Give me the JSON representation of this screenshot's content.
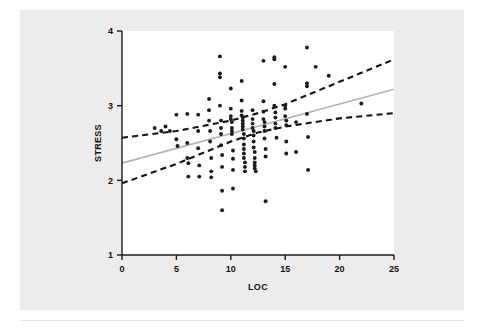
{
  "figure": {
    "background_color": "#ececec",
    "plot_background_color": "#ffffff"
  },
  "chart_data": {
    "type": "scatter",
    "title": "",
    "xlabel": "LOC",
    "ylabel": "STRESS",
    "xlim": [
      0,
      25
    ],
    "ylim": [
      1,
      4
    ],
    "xticks": [
      0,
      5,
      10,
      15,
      20,
      25
    ],
    "xtick_labels": [
      "0",
      "5",
      "10",
      "15",
      "20",
      "25"
    ],
    "yticks": [
      1,
      2,
      3,
      4
    ],
    "ytick_labels": [
      "1",
      "2",
      "3",
      "4"
    ],
    "grid": false,
    "legend": "none",
    "point_color": "#1b1b1b",
    "point_size_px": 3.0,
    "series": [
      {
        "name": "observations",
        "marker": "circle",
        "points": [
          [
            3.0,
            2.7
          ],
          [
            3.6,
            2.66
          ],
          [
            4.0,
            2.72
          ],
          [
            4.4,
            2.66
          ],
          [
            5.0,
            2.88
          ],
          [
            5.0,
            2.55
          ],
          [
            5.1,
            2.46
          ],
          [
            6.0,
            2.89
          ],
          [
            6.0,
            2.5
          ],
          [
            6.0,
            2.3
          ],
          [
            6.1,
            2.23
          ],
          [
            6.1,
            2.05
          ],
          [
            7.0,
            2.88
          ],
          [
            7.0,
            2.66
          ],
          [
            7.0,
            2.43
          ],
          [
            7.1,
            2.2
          ],
          [
            7.1,
            2.05
          ],
          [
            8.0,
            3.09
          ],
          [
            8.0,
            2.94
          ],
          [
            8.0,
            2.8
          ],
          [
            8.1,
            2.66
          ],
          [
            8.1,
            2.52
          ],
          [
            8.2,
            2.3
          ],
          [
            8.2,
            2.12
          ],
          [
            8.2,
            2.04
          ],
          [
            9.0,
            3.66
          ],
          [
            9.0,
            3.43
          ],
          [
            9.0,
            3.38
          ],
          [
            9.0,
            3.0
          ],
          [
            9.1,
            2.8
          ],
          [
            9.1,
            2.7
          ],
          [
            9.1,
            2.62
          ],
          [
            9.1,
            2.47
          ],
          [
            9.2,
            2.34
          ],
          [
            9.2,
            2.18
          ],
          [
            9.2,
            1.86
          ],
          [
            9.2,
            1.6
          ],
          [
            10.0,
            3.23
          ],
          [
            10.0,
            2.96
          ],
          [
            10.0,
            2.86
          ],
          [
            10.0,
            2.82
          ],
          [
            10.1,
            2.78
          ],
          [
            10.1,
            2.7
          ],
          [
            10.1,
            2.66
          ],
          [
            10.1,
            2.62
          ],
          [
            10.2,
            2.4
          ],
          [
            10.2,
            2.29
          ],
          [
            10.2,
            2.14
          ],
          [
            10.2,
            1.89
          ],
          [
            11.0,
            3.33
          ],
          [
            11.0,
            3.07
          ],
          [
            11.0,
            2.93
          ],
          [
            11.0,
            2.87
          ],
          [
            11.1,
            2.84
          ],
          [
            11.1,
            2.8
          ],
          [
            11.1,
            2.76
          ],
          [
            11.1,
            2.72
          ],
          [
            11.1,
            2.68
          ],
          [
            11.2,
            2.62
          ],
          [
            11.2,
            2.56
          ],
          [
            11.2,
            2.48
          ],
          [
            11.2,
            2.42
          ],
          [
            11.2,
            2.36
          ],
          [
            11.2,
            2.3
          ],
          [
            11.3,
            2.24
          ],
          [
            11.3,
            2.18
          ],
          [
            11.3,
            2.12
          ],
          [
            12.0,
            2.94
          ],
          [
            12.0,
            2.82
          ],
          [
            12.0,
            2.76
          ],
          [
            12.0,
            2.7
          ],
          [
            12.1,
            2.66
          ],
          [
            12.1,
            2.6
          ],
          [
            12.1,
            2.52
          ],
          [
            12.1,
            2.44
          ],
          [
            12.2,
            2.38
          ],
          [
            12.2,
            2.3
          ],
          [
            12.2,
            2.24
          ],
          [
            12.2,
            2.2
          ],
          [
            12.2,
            2.16
          ],
          [
            12.3,
            2.12
          ],
          [
            13.0,
            3.6
          ],
          [
            13.0,
            3.06
          ],
          [
            13.0,
            2.92
          ],
          [
            13.0,
            2.82
          ],
          [
            13.1,
            2.78
          ],
          [
            13.1,
            2.72
          ],
          [
            13.1,
            2.66
          ],
          [
            13.1,
            2.56
          ],
          [
            13.2,
            2.42
          ],
          [
            13.2,
            2.32
          ],
          [
            13.2,
            1.72
          ],
          [
            14.0,
            3.65
          ],
          [
            14.0,
            3.62
          ],
          [
            14.0,
            3.29
          ],
          [
            14.0,
            3.0
          ],
          [
            14.1,
            2.91
          ],
          [
            14.1,
            2.84
          ],
          [
            14.1,
            2.76
          ],
          [
            14.1,
            2.7
          ],
          [
            14.2,
            2.57
          ],
          [
            15.0,
            3.52
          ],
          [
            15.0,
            3.0
          ],
          [
            15.0,
            2.96
          ],
          [
            15.0,
            2.86
          ],
          [
            15.1,
            2.8
          ],
          [
            15.1,
            2.74
          ],
          [
            15.1,
            2.52
          ],
          [
            15.1,
            2.36
          ],
          [
            16.0,
            2.78
          ],
          [
            16.0,
            2.38
          ],
          [
            17.0,
            3.78
          ],
          [
            17.0,
            3.3
          ],
          [
            17.0,
            3.26
          ],
          [
            17.0,
            2.89
          ],
          [
            17.1,
            2.58
          ],
          [
            17.1,
            2.14
          ],
          [
            17.8,
            3.52
          ],
          [
            19.0,
            3.4
          ],
          [
            22.0,
            3.03
          ]
        ]
      }
    ],
    "fit_line": {
      "name": "regression-fit",
      "color": "#b4b4b4",
      "style": "solid",
      "x0": 0,
      "y0": 2.23,
      "x1": 25,
      "y1": 3.22
    },
    "confidence_bands": [
      {
        "name": "upper-confidence-band",
        "color": "#131313",
        "style": "dashed",
        "points": [
          [
            0,
            2.57
          ],
          [
            5,
            2.66
          ],
          [
            10,
            2.8
          ],
          [
            12.5,
            2.9
          ],
          [
            15,
            3.02
          ],
          [
            20,
            3.32
          ],
          [
            25,
            3.62
          ]
        ]
      },
      {
        "name": "lower-confidence-band",
        "color": "#131313",
        "style": "dashed",
        "points": [
          [
            0,
            1.96
          ],
          [
            5,
            2.22
          ],
          [
            10,
            2.52
          ],
          [
            12.5,
            2.64
          ],
          [
            15,
            2.72
          ],
          [
            20,
            2.83
          ],
          [
            25,
            2.9
          ]
        ]
      }
    ]
  }
}
